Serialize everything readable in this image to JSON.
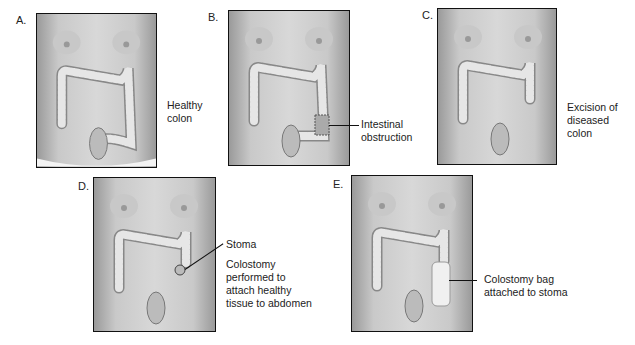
{
  "figure": {
    "panels": [
      {
        "id": "A",
        "label": "A.",
        "caption": "Healthy\ncolon",
        "state": "healthy"
      },
      {
        "id": "B",
        "label": "B.",
        "caption": "Intestinal\nobstruction",
        "state": "obstruction"
      },
      {
        "id": "C",
        "label": "C.",
        "caption": "Excision of\ndiseased\ncolon",
        "state": "excision"
      },
      {
        "id": "D",
        "label": "D.",
        "caption_stoma": "Stoma",
        "caption": "Colostomy\nperformed to\nattach healthy\ntissue to abdomen",
        "state": "colostomy"
      },
      {
        "id": "E",
        "label": "E.",
        "caption": "Colostomy bag\nattached to stoma",
        "state": "bag"
      }
    ]
  },
  "colors": {
    "frame_border": "#111111",
    "skin_dark": "#9a9a9a",
    "skin_light": "#d8d8d8",
    "colon": "#e6e6e6",
    "colon_outline": "#888888",
    "text": "#222222"
  }
}
